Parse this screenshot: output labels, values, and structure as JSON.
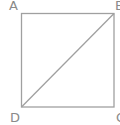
{
  "diagram": {
    "type": "geometry",
    "shape": "square",
    "stroke_color": "#a0a0a0",
    "label_color": "#8a8a8a",
    "vertices": [
      {
        "label": "A",
        "x": 21,
        "y": 13
      },
      {
        "label": "B",
        "x": 114,
        "y": 13
      },
      {
        "label": "C",
        "x": 114,
        "y": 107
      },
      {
        "label": "D",
        "x": 21,
        "y": 107
      }
    ],
    "diagonal": {
      "from": "B",
      "to": "D"
    }
  }
}
